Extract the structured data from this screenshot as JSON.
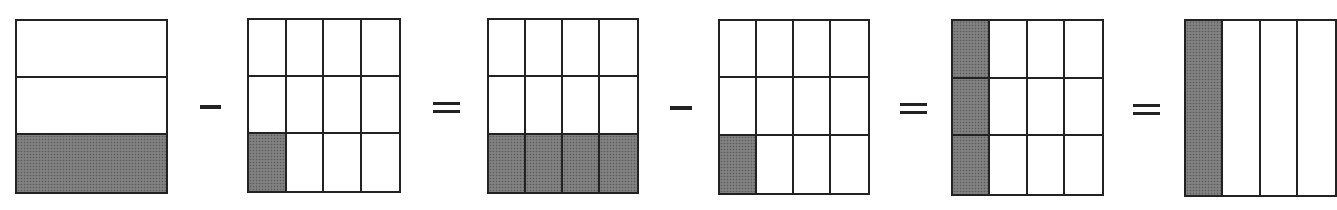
{
  "diagram": {
    "colors": {
      "shaded": "#7a7a7a",
      "line": "#222222",
      "background": "#ffffff"
    },
    "boxes": [
      {
        "id": "one-third",
        "fraction": "1/3",
        "cols": 1,
        "rows": 3,
        "shaded": [
          [
            2,
            0
          ]
        ],
        "x": 15,
        "y": 19,
        "w": 153,
        "h": 175
      },
      {
        "id": "one-twelfth-a",
        "fraction": "1/12",
        "cols": 4,
        "rows": 3,
        "shaded": [
          [
            2,
            0
          ]
        ],
        "x": 247,
        "y": 18,
        "w": 154,
        "h": 175
      },
      {
        "id": "four-twelfths",
        "fraction": "4/12",
        "cols": 4,
        "rows": 3,
        "shaded": [
          [
            2,
            0
          ],
          [
            2,
            1
          ],
          [
            2,
            2
          ],
          [
            2,
            3
          ]
        ],
        "x": 487,
        "y": 18,
        "w": 152,
        "h": 176
      },
      {
        "id": "one-twelfth-b",
        "fraction": "1/12",
        "cols": 4,
        "rows": 3,
        "shaded": [
          [
            2,
            0
          ]
        ],
        "x": 718,
        "y": 19,
        "w": 152,
        "h": 176
      },
      {
        "id": "three-twelfths",
        "fraction": "3/12",
        "cols": 4,
        "rows": 3,
        "shaded": [
          [
            0,
            0
          ],
          [
            1,
            0
          ],
          [
            2,
            0
          ]
        ],
        "x": 951,
        "y": 19,
        "w": 153,
        "h": 177
      },
      {
        "id": "one-fourth",
        "fraction": "1/4",
        "cols": 4,
        "rows": 1,
        "shaded": [
          [
            0,
            0
          ]
        ],
        "x": 1184,
        "y": 19,
        "w": 153,
        "h": 178
      }
    ],
    "operators": [
      {
        "symbol": "minus",
        "x": 200,
        "y": 105,
        "w": 21
      },
      {
        "symbol": "equals",
        "x": 433,
        "y": 102,
        "w": 27
      },
      {
        "symbol": "minus",
        "x": 670,
        "y": 106,
        "w": 22
      },
      {
        "symbol": "equals",
        "x": 900,
        "y": 103,
        "w": 27
      },
      {
        "symbol": "equals",
        "x": 1133,
        "y": 104,
        "w": 27
      }
    ]
  }
}
